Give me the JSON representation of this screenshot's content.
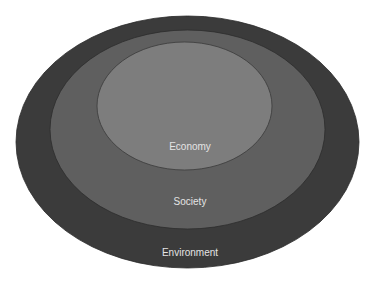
{
  "diagram": {
    "type": "nested-ellipses",
    "layers": [
      {
        "label": "Environment",
        "color": "#3b3b3b"
      },
      {
        "label": "Society",
        "color": "#5f5f5f"
      },
      {
        "label": "Economy",
        "color": "#7d7d7d"
      }
    ],
    "label_color": "#e4e4e4"
  }
}
